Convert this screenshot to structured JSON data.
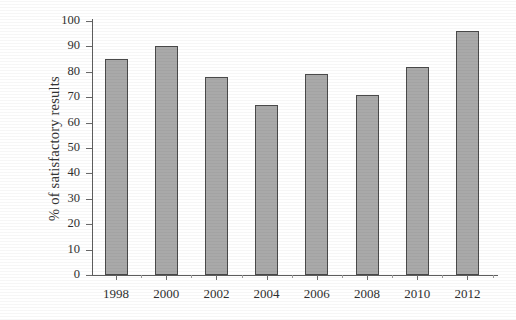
{
  "chart_data": {
    "type": "bar",
    "title": "",
    "subtitle": "",
    "xlabel": "",
    "ylabel": "% of satisfactory results",
    "categories": [
      "1998",
      "2000",
      "2002",
      "2004",
      "2006",
      "2008",
      "2010",
      "2012"
    ],
    "values": [
      85,
      90,
      78,
      67,
      79,
      71,
      82,
      96
    ],
    "series": [
      {
        "name": "% of satisfactory results",
        "values": [
          85,
          90,
          78,
          67,
          79,
          71,
          82,
          96
        ]
      }
    ],
    "ylim": [
      0,
      100
    ],
    "y_ticks": [
      100,
      90,
      80,
      70,
      60,
      50,
      40,
      30,
      20,
      10,
      0
    ],
    "y_tick_labels": [
      "100",
      "90",
      "80",
      "70",
      "60",
      "50",
      "40",
      "30",
      "20",
      "10",
      "0"
    ],
    "x_tick_labels": [
      "1998",
      "2000",
      "2002",
      "2004",
      "2006",
      "2008",
      "2010",
      "2012"
    ],
    "grid": false,
    "legend": false,
    "legend_position": "none",
    "annotations": [],
    "colors": {
      "bar_fill": "#a9a9a9",
      "bar_border": "#4a4a4a",
      "axis": "#5d5d5d",
      "text": "#2f2f2f",
      "background": "#ffffff"
    }
  }
}
